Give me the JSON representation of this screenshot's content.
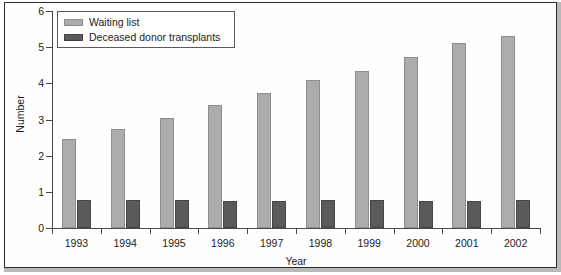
{
  "chart_data": {
    "type": "bar",
    "title": "",
    "subtitle": "",
    "xlabel": "Year",
    "ylabel": "Number",
    "categories": [
      "1993",
      "1994",
      "1995",
      "1996",
      "1997",
      "1998",
      "1999",
      "2000",
      "2001",
      "2002"
    ],
    "series": [
      {
        "name": "Waiting list",
        "color": "#acacac",
        "values": [
          2.45,
          2.75,
          3.05,
          3.4,
          3.72,
          4.08,
          4.34,
          4.72,
          5.11,
          5.3
        ]
      },
      {
        "name": "Deceased donor transplants",
        "color": "#5a5a5a",
        "values": [
          0.78,
          0.78,
          0.78,
          0.74,
          0.74,
          0.77,
          0.77,
          0.76,
          0.76,
          0.78
        ]
      }
    ],
    "ylim": [
      0,
      6
    ],
    "yticks": [
      0,
      1,
      2,
      3,
      4,
      5,
      6
    ],
    "ytick_labels": [
      "0",
      "1",
      "2",
      "3",
      "4",
      "5",
      "6"
    ],
    "grid": false,
    "legend_position": "top-left"
  },
  "legend": {
    "entries": [
      {
        "label": "Waiting list",
        "swatch": "light-gray-swatch"
      },
      {
        "label": "Deceased donor transplants",
        "swatch": "dark-gray-swatch"
      }
    ]
  },
  "colors": {
    "waiting_list": "#acacac",
    "deceased_donor_transplants": "#5a5a5a",
    "axis": "#4a4a4a",
    "frame": "#2b2b2b",
    "text": "#1c1c1c"
  }
}
